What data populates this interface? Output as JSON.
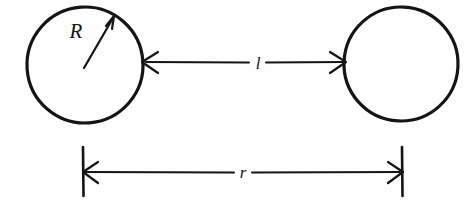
{
  "figure": {
    "type": "geometric-diagram",
    "background_color": "#fefefe",
    "ink_color": "#141414"
  },
  "labels": {
    "radius": "R",
    "gap": "l",
    "center_distance": "r"
  },
  "shapes": {
    "left_circle": {
      "name": "left-circle",
      "cx": 85,
      "cy": 65,
      "r": 58
    },
    "right_circle": {
      "name": "right-circle",
      "cx": 401,
      "cy": 64,
      "r": 57
    }
  },
  "measurements": {
    "radius_arrow": {
      "label": "R",
      "from_x": 84,
      "from_y": 67,
      "to_x": 114,
      "to_y": 17,
      "label_x": 76,
      "label_y": 37
    },
    "gap_arrow": {
      "label": "l",
      "y": 62,
      "from_x": 143,
      "to_x": 345,
      "label_x": 257,
      "label_y": 68
    },
    "center_distance_arrow": {
      "label": "r",
      "y": 172,
      "from_x": 83,
      "to_x": 402,
      "tick_top": 147,
      "tick_bottom": 196,
      "label_x": 243,
      "label_y": 178
    }
  }
}
